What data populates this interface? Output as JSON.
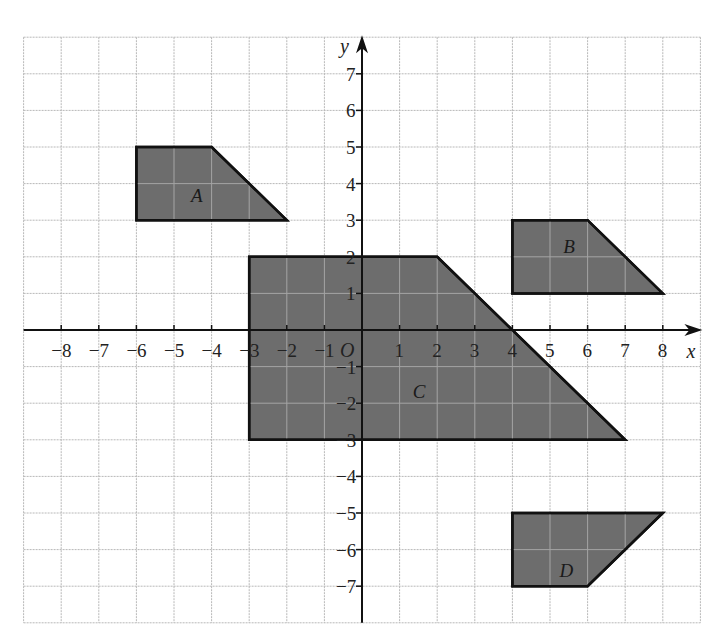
{
  "figure": {
    "grid": {
      "x_min": -9,
      "x_max": 9,
      "y_min": -8,
      "y_max": 8
    },
    "axes": {
      "x_label": "x",
      "y_label": "y",
      "origin_label": "O",
      "x_ticks": [
        -8,
        -7,
        -6,
        -5,
        -4,
        -3,
        -2,
        -1,
        1,
        2,
        3,
        4,
        5,
        6,
        7,
        8
      ],
      "y_ticks": [
        7,
        6,
        5,
        4,
        3,
        2,
        1,
        -1,
        -2,
        -3,
        -4,
        -5,
        -6,
        -7
      ]
    },
    "shapes": [
      {
        "label": "A",
        "vertices": [
          [
            -6,
            5
          ],
          [
            -4,
            5
          ],
          [
            -2,
            3
          ],
          [
            -6,
            3
          ]
        ],
        "label_pos": [
          -4.55,
          3.5
        ]
      },
      {
        "label": "B",
        "vertices": [
          [
            4,
            3
          ],
          [
            6,
            3
          ],
          [
            8,
            1
          ],
          [
            4,
            1
          ]
        ],
        "label_pos": [
          5.35,
          2.1
        ]
      },
      {
        "label": "C",
        "vertices": [
          [
            -3,
            2
          ],
          [
            2,
            2
          ],
          [
            7,
            -3
          ],
          [
            -3,
            -3
          ]
        ],
        "label_pos": [
          1.35,
          -1.85
        ]
      },
      {
        "label": "D",
        "vertices": [
          [
            4,
            -5
          ],
          [
            8,
            -5
          ],
          [
            6,
            -7
          ],
          [
            4,
            -7
          ]
        ],
        "label_pos": [
          5.25,
          -6.75
        ]
      }
    ],
    "colors": {
      "shape_fill": "#6e6e6e",
      "shape_stroke": "#111111",
      "grid": "#b8b8b8",
      "axis": "#111111"
    }
  }
}
